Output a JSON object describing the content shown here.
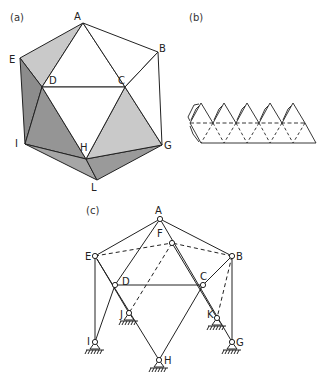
{
  "panels": {
    "a": {
      "label": "(a)",
      "vertices": [
        "A",
        "B",
        "C",
        "D",
        "E",
        "G",
        "H",
        "I",
        "L"
      ]
    },
    "b": {
      "label": "(b)"
    },
    "c": {
      "label": "(c)",
      "vertices": [
        "A",
        "B",
        "C",
        "D",
        "E",
        "F",
        "G",
        "H",
        "I",
        "J",
        "K"
      ]
    }
  },
  "colors": {
    "stroke": "#222222",
    "face_light": "#c9c9c9",
    "face_mid": "#a6a6a6",
    "face_dark": "#8c8c8c",
    "face_darker": "#959595",
    "face_white": "#ffffff"
  }
}
